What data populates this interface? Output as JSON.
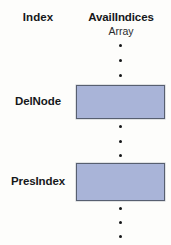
{
  "diagram": {
    "columns": {
      "index_header": "Index",
      "array_header_line1": "AvailIndices",
      "array_header_line2": "Array"
    },
    "rows": [
      {
        "label": "DelNode",
        "cell_value": ""
      },
      {
        "label": "PresIndex",
        "cell_value": ""
      }
    ],
    "ellipsis_groups": [
      {
        "name": "top-ellipsis",
        "dots": 3
      },
      {
        "name": "middle-ellipsis",
        "dots": 3
      },
      {
        "name": "bottom-ellipsis",
        "dots": 3
      }
    ],
    "colors": {
      "cell_fill": "#a9b4d8",
      "cell_border": "#575f70",
      "text": "#16181a",
      "background": "#fdfdfb",
      "dot": "#141618"
    }
  }
}
